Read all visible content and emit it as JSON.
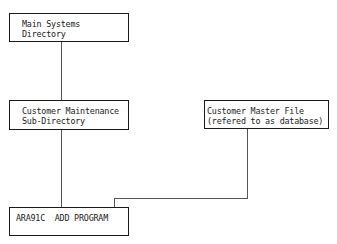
{
  "diagram": {
    "nodes": [
      {
        "id": "main",
        "lines": [
          "Main Systems",
          "Directory"
        ]
      },
      {
        "id": "sub",
        "lines": [
          "Customer Maintenance",
          "Sub-Directory"
        ]
      },
      {
        "id": "master",
        "lines": [
          "Customer Master File",
          "(refered to as database)"
        ]
      },
      {
        "id": "program",
        "lines": [
          "ARA91C  ADD PROGRAM"
        ]
      }
    ],
    "edges": [
      {
        "from": "main",
        "to": "sub"
      },
      {
        "from": "sub",
        "to": "program"
      },
      {
        "from": "master",
        "to": "program"
      }
    ],
    "colors": {
      "line": "#555555",
      "border": "#1a1a1a",
      "text": "#1a1a1a",
      "background": "#ffffff"
    }
  }
}
